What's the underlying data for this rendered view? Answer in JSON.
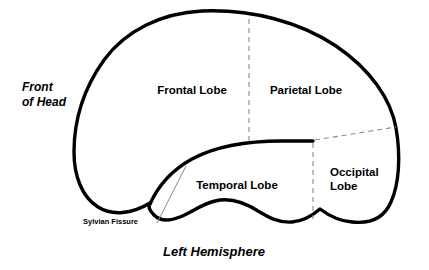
{
  "diagram": {
    "title": "Left Hemisphere",
    "caption": "Left Hemisphere",
    "orientation_label_line1": "Front",
    "orientation_label_line2": "of Head",
    "colors": {
      "outline": "#000000",
      "divider": "#8a8a8a",
      "background": "#ffffff",
      "text": "#000000"
    },
    "lobes": [
      {
        "id": "frontal",
        "label": "Frontal Lobe"
      },
      {
        "id": "parietal",
        "label": "Parietal Lobe"
      },
      {
        "id": "temporal",
        "label": "Temporal Lobe"
      },
      {
        "id": "occipital",
        "label_line1": "Occipital",
        "label_line2": "Lobe"
      }
    ],
    "annotations": [
      {
        "id": "sylvian-fissure",
        "label": "Sylvian Fissure"
      }
    ]
  }
}
